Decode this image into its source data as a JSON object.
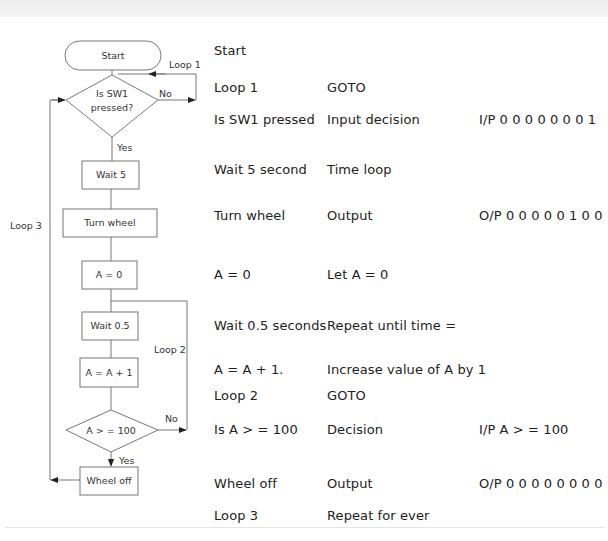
{
  "flowchart": {
    "nodes": {
      "start": "Start",
      "decision1_line1": "Is SW1",
      "decision1_line2": "pressed?",
      "wait5": "Wait 5",
      "turn_wheel": "Turn wheel",
      "a_zero": "A = 0",
      "wait05": "Wait 0.5",
      "a_inc": "A = A + 1",
      "decision2": "A > = 100",
      "wheel_off": "Wheel off"
    },
    "labels": {
      "loop1": "Loop 1",
      "loop2": "Loop 2",
      "loop3": "Loop 3",
      "no1": "No",
      "yes1": "Yes",
      "no2": "No",
      "yes2": "Yes"
    }
  },
  "table": {
    "rows": [
      {
        "step": "Start",
        "action": "",
        "io": ""
      },
      {
        "step": "Loop 1",
        "action": "GOTO",
        "io": ""
      },
      {
        "step": "Is SW1 pressed",
        "action": "Input decision",
        "io": "I/P 0 0 0 0 0 0 0 1"
      },
      {
        "step": "Wait 5 second",
        "action": "Time loop",
        "io": ""
      },
      {
        "step": "Turn wheel",
        "action": "Output",
        "io": "O/P 0 0 0 0 0 1 0 0"
      },
      {
        "step": "A = 0",
        "action": "Let A = 0",
        "io": ""
      },
      {
        "step": "Wait 0.5 seconds",
        "action": "Repeat until time =",
        "io": ""
      },
      {
        "step": "A = A + 1.",
        "action": "Increase value of A by 1",
        "io": ""
      },
      {
        "step": "Loop 2",
        "action": "GOTO",
        "io": ""
      },
      {
        "step": "Is A > = 100",
        "action": "Decision",
        "io": "I/P A > = 100"
      },
      {
        "step": "Wheel off",
        "action": "Output",
        "io": "O/P 0 0 0 0 0 0 0 0"
      },
      {
        "step": "Loop 3",
        "action": "Repeat for ever",
        "io": ""
      }
    ]
  }
}
